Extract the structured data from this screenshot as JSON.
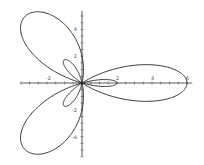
{
  "chart_data": {
    "type": "line",
    "title": "",
    "equation": {
      "a": 2,
      "b": 4,
      "k": 3
    },
    "xlabel": "",
    "ylabel": "",
    "xlim": [
      -3.5,
      6.3
    ],
    "ylim": [
      -5.5,
      5.4
    ],
    "x_ticks": [
      -2,
      2,
      4,
      6
    ],
    "y_ticks": [
      4,
      2,
      -2,
      -4
    ],
    "tick_step": 0.5,
    "grid": false,
    "line_color": "#222222",
    "axis_color": "#333333"
  },
  "layout": {
    "origin_px": [
      82,
      83
    ],
    "px_per_unit_x": 17.5,
    "px_per_unit_y": 13.4
  }
}
